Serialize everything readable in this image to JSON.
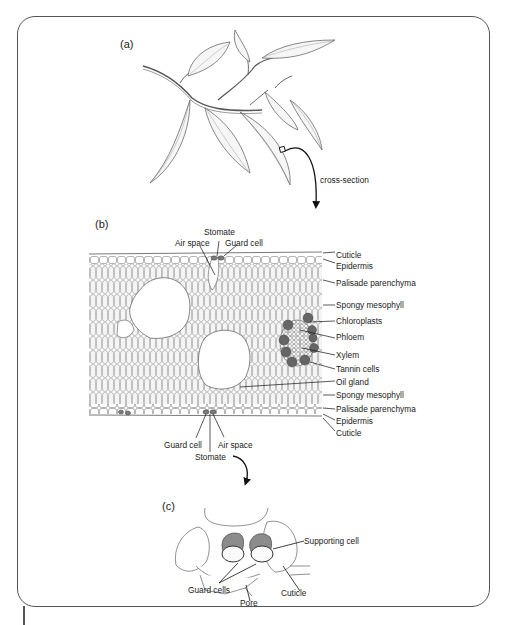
{
  "panels": {
    "a": {
      "label": "(a)",
      "arrow_label": "cross-section"
    },
    "b": {
      "label": "(b)",
      "top_labels": {
        "stomate": "Stomate",
        "air_space": "Air space",
        "guard_cell": "Guard cell"
      },
      "right_labels": [
        "Cuticle",
        "Epidermis",
        "Palisade parenchyma",
        "Spongy mesophyll",
        "Chloroplasts",
        "Phloem",
        "Xylem",
        "Tannin cells",
        "Oil gland",
        "Spongy mesophyll",
        "Palisade parenchyma",
        "Epidermis",
        "Cuticle"
      ],
      "bottom_labels": {
        "guard_cell": "Guard cell",
        "air_space": "Air space",
        "stomate": "Stomate"
      }
    },
    "c": {
      "label": "(c)",
      "labels": {
        "supporting_cell": "Supporting cell",
        "guard_cells": "Guard cells",
        "pore": "Pore",
        "cuticle": "Cuticle"
      }
    }
  },
  "colors": {
    "line": "#3a3a3a",
    "dark_cell": "#6a6a6a",
    "guard_fill": "#8c8c8c",
    "leaf_fill": "#f4f4f4"
  }
}
